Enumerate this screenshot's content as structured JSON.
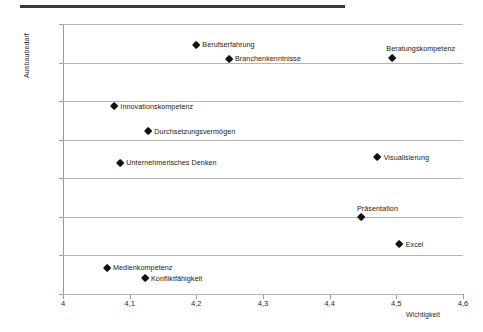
{
  "chart_data": {
    "type": "scatter",
    "title": "",
    "xlabel": "Wichtigkeit",
    "ylabel": "Ausbaubedarf",
    "xlim": [
      4,
      4.6
    ],
    "ylim": [
      25,
      60
    ],
    "xticks": [
      "4",
      "4,1",
      "4,2",
      "4,3",
      "4,4",
      "4,5",
      "4,6"
    ],
    "xtick_values": [
      4,
      4.1,
      4.2,
      4.3,
      4.4,
      4.5,
      4.6
    ],
    "yticks": [
      "25%",
      "30%",
      "35%",
      "40%",
      "45%",
      "50%",
      "55%",
      "60%"
    ],
    "ytick_values": [
      25,
      30,
      35,
      40,
      45,
      50,
      55,
      60
    ],
    "grid": "horizontal",
    "legend": "none",
    "marker_color": "#121212",
    "grid_color": "#b5b5b5",
    "points": [
      {
        "label": "Berufserfahrung",
        "x": 4.2,
        "y": 57.3,
        "label_pos": "right"
      },
      {
        "label": "Branchenkenntnisse",
        "x": 4.249,
        "y": 55.5,
        "label_pos": "right"
      },
      {
        "label": "Beratungskompetenz",
        "x": 4.494,
        "y": 55.6,
        "label_pos": "above-right"
      },
      {
        "label": "Innovationskompetenz",
        "x": 4.077,
        "y": 49.3,
        "label_pos": "right"
      },
      {
        "label": "Durchsetzungsvermögen",
        "x": 4.128,
        "y": 46.1,
        "label_pos": "right"
      },
      {
        "label": "Unternehmerisches Denken",
        "x": 4.086,
        "y": 42.0,
        "label_pos": "right"
      },
      {
        "label": "Visualisierung",
        "x": 4.472,
        "y": 42.7,
        "label_pos": "right"
      },
      {
        "label": "Präsentation",
        "x": 4.447,
        "y": 34.9,
        "label_pos": "above"
      },
      {
        "label": "Excel",
        "x": 4.505,
        "y": 31.4,
        "label_pos": "right"
      },
      {
        "label": "Medienkompetenz",
        "x": 4.066,
        "y": 28.4,
        "label_pos": "right"
      },
      {
        "label": "Konfliktfähigkeit",
        "x": 4.123,
        "y": 27.0,
        "label_pos": "right"
      }
    ]
  }
}
